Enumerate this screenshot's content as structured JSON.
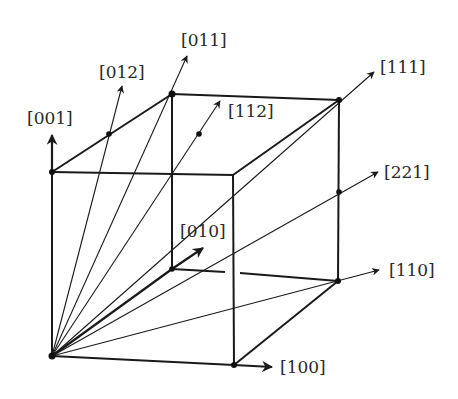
{
  "diagram": {
    "title": "",
    "colors": {
      "line": "#1a1a1a",
      "text": "#2a2a2a",
      "background": "#ffffff"
    },
    "labels": {
      "d001": "[001]",
      "d012": "[012]",
      "d011": "[011]",
      "d112": "[112]",
      "d111": "[111]",
      "d221": "[221]",
      "d010": "[010]",
      "d110": "[110]",
      "d100": "[100]"
    },
    "directions": [
      {
        "id": "001",
        "label": "[001]",
        "from": "origin",
        "to": "top-front-left"
      },
      {
        "id": "012",
        "label": "[012]",
        "from": "origin",
        "through": "midpoint of top-left edge"
      },
      {
        "id": "011",
        "label": "[011]",
        "from": "origin",
        "through": "top-back-left corner"
      },
      {
        "id": "112",
        "label": "[112]",
        "from": "origin",
        "through": "center of top face"
      },
      {
        "id": "111",
        "label": "[111]",
        "from": "origin",
        "through": "top-back-right corner"
      },
      {
        "id": "221",
        "label": "[221]",
        "from": "origin",
        "through": "midpoint of back-right vertical edge"
      },
      {
        "id": "010",
        "label": "[010]",
        "from": "origin",
        "through": "bottom-back-left corner"
      },
      {
        "id": "110",
        "label": "[110]",
        "from": "origin",
        "through": "bottom-back-right corner"
      },
      {
        "id": "100",
        "label": "[100]",
        "from": "origin",
        "through": "bottom-front-right corner"
      }
    ]
  }
}
